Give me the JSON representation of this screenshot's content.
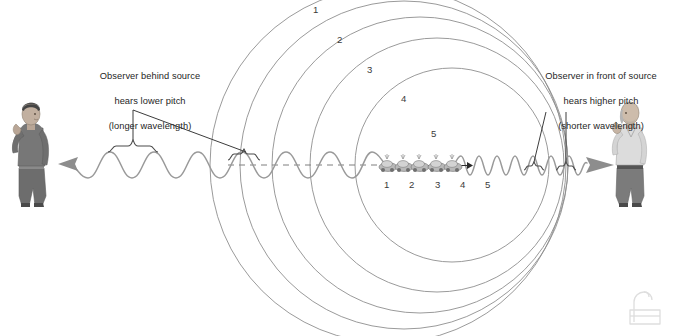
{
  "diagram": {
    "background_color": "#ffffff",
    "line_color": "#8a8a8a",
    "dark_line_color": "#333333",
    "text_color": "#262626"
  },
  "annotations": {
    "left": {
      "text": "Observer behind source\nhears lower pitch\n(longer wavelength)",
      "line1": "Observer behind source",
      "line2": "hears lower pitch",
      "line3": "(longer wavelength)"
    },
    "right": {
      "text": "Observer in front of source\nhears higher pitch\n(shorter wavelength)",
      "line1": "Observer in front of source",
      "line2": "hears higher pitch",
      "line3": "(shorter wavelength)"
    }
  },
  "wavefronts": {
    "label_note": "expanding circular wavefronts emitted at successive source positions",
    "labels": [
      "1",
      "2",
      "3",
      "4",
      "5"
    ],
    "circles": [
      {
        "label": "1",
        "cx": 388,
        "cy": 165,
        "r": 178,
        "label_x": 316,
        "label_y": 8
      },
      {
        "label": "2",
        "cx": 404,
        "cy": 165,
        "r": 164,
        "label_x": 339,
        "label_y": 38
      },
      {
        "label": "3",
        "cx": 420,
        "cy": 165,
        "r": 148,
        "label_x": 369,
        "label_y": 68
      },
      {
        "label": "4",
        "cx": 437,
        "cy": 165,
        "r": 127,
        "label_x": 402,
        "label_y": 97
      },
      {
        "label": "5",
        "cx": 452,
        "cy": 165,
        "r": 97,
        "label_x": 432,
        "label_y": 131
      }
    ]
  },
  "source": {
    "name": "moving sound source",
    "direction": "right",
    "labels": [
      "1",
      "2",
      "3",
      "4",
      "5"
    ],
    "positions": [
      {
        "label": "1",
        "x": 388,
        "label_x": 384,
        "label_y": 178
      },
      {
        "label": "2",
        "x": 404,
        "label_x": 410,
        "label_y": 178
      },
      {
        "label": "3",
        "x": 420,
        "label_x": 437,
        "label_y": 178
      },
      {
        "label": "4",
        "x": 437,
        "label_x": 462,
        "label_y": 178
      },
      {
        "label": "5",
        "x": 452,
        "label_x": 487,
        "label_y": 178
      }
    ]
  },
  "observers": {
    "left": {
      "name": "observer-behind-source",
      "position": "left",
      "description": "person facing right, hand raised to ear"
    },
    "right": {
      "name": "observer-in-front-of-source",
      "position": "right",
      "description": "person facing left, hand raised to ear"
    }
  },
  "waves": {
    "left": {
      "name": "long-wavelength-wave",
      "direction": "leftward",
      "wavelength_px": 48,
      "bracket_label": "longer wavelength"
    },
    "right": {
      "name": "short-wavelength-wave",
      "direction": "rightward",
      "wavelength_px": 15,
      "bracket_label": "shorter wavelength"
    }
  },
  "centerline": {
    "name": "axis-of-motion",
    "style": "dashed"
  },
  "watermark": {
    "name": "watermark-logo",
    "x": 628,
    "y": 292
  }
}
